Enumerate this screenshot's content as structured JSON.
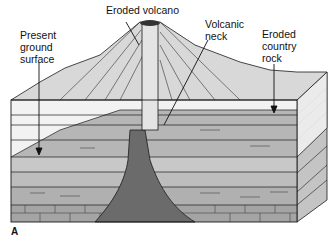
{
  "labels": {
    "eroded_volcano": "Eroded volcano",
    "present_ground_surface": "Present\nground\nsurface",
    "volcanic_neck": "Volcanic\nneck",
    "eroded_country_rock": "Eroded\ncountry\nrock"
  },
  "figure_label": "A",
  "colors": {
    "light_layer": "#f2f2f2",
    "mid_gray": "#b4b4b4",
    "sand_gray": "#c9c9c9",
    "dark_neck": "#6e6e6e",
    "cone": "#d6d6d6",
    "line": "#1a1a1a"
  }
}
